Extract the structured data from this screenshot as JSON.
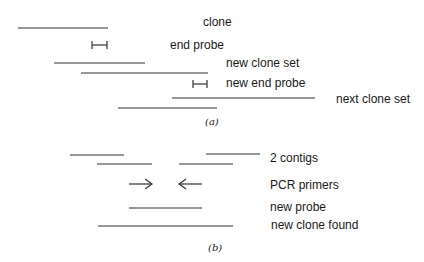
{
  "panel_a": {
    "labels": {
      "clone": "clone",
      "end_probe": "end probe",
      "new_clone_set": "new clone set",
      "new_end_probe": "new end probe",
      "next_clone_set": "next clone set"
    },
    "caption": "(a)"
  },
  "panel_b": {
    "labels": {
      "contigs": "2 contigs",
      "pcr_primers": "PCR primers",
      "new_probe": "new probe",
      "new_clone_found": "new clone found"
    },
    "caption": "(b)"
  },
  "colors": {
    "line": "#333333",
    "text": "#1a1a1a"
  }
}
